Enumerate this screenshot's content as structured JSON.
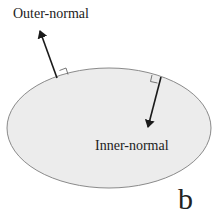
{
  "figure": {
    "panel_letter": "b",
    "labels": {
      "outer_normal": "Outer-normal",
      "inner_normal": "Inner-normal"
    },
    "colors": {
      "region_fill": "#ececec",
      "region_stroke": "#8a8a8a",
      "arrow": "#1a1a1a",
      "text": "#222222"
    }
  }
}
